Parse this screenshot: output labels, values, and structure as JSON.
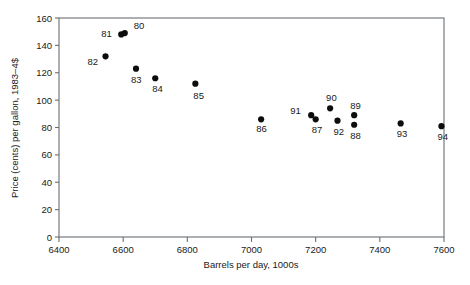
{
  "chart_data": {
    "type": "scatter",
    "title": "",
    "xlabel": "Barrels per day, 1000s",
    "ylabel": "Price (cents) per gallon, 1983–4$",
    "xlim": [
      6400,
      7600
    ],
    "ylim": [
      0,
      160
    ],
    "xticks": [
      6400,
      6600,
      6800,
      7000,
      7200,
      7400,
      7600
    ],
    "yticks": [
      0,
      20,
      40,
      60,
      80,
      100,
      120,
      140,
      160
    ],
    "grid": false,
    "legend": null,
    "point_color": "#0d0d0d",
    "frame_color": "#6b6f74",
    "points": [
      {
        "label": "80",
        "x": 6605,
        "y": 149,
        "label_dx": 9,
        "label_dy": -4
      },
      {
        "label": "81",
        "x": 6594,
        "y": 148,
        "label_dx": -20,
        "label_dy": 3
      },
      {
        "label": "82",
        "x": 6545,
        "y": 132,
        "label_dx": -18,
        "label_dy": 9
      },
      {
        "label": "83",
        "x": 6640,
        "y": 123,
        "label_dx": -5,
        "label_dy": 14
      },
      {
        "label": "84",
        "x": 6700,
        "y": 116,
        "label_dx": -3,
        "label_dy": 14
      },
      {
        "label": "85",
        "x": 6825,
        "y": 112,
        "label_dx": -2,
        "label_dy": 15
      },
      {
        "label": "86",
        "x": 7030,
        "y": 86,
        "label_dx": -5,
        "label_dy": 13
      },
      {
        "label": "87",
        "x": 7200,
        "y": 86,
        "label_dx": -4,
        "label_dy": 14
      },
      {
        "label": "88",
        "x": 7320,
        "y": 82,
        "label_dx": -4,
        "label_dy": 14
      },
      {
        "label": "89",
        "x": 7320,
        "y": 89,
        "label_dx": -4,
        "label_dy": -6
      },
      {
        "label": "90",
        "x": 7245,
        "y": 94,
        "label_dx": -4,
        "label_dy": -7
      },
      {
        "label": "91",
        "x": 7186,
        "y": 89,
        "label_dx": -21,
        "label_dy": -1
      },
      {
        "label": "92",
        "x": 7268,
        "y": 85,
        "label_dx": -4,
        "label_dy": 14
      },
      {
        "label": "93",
        "x": 7465,
        "y": 83,
        "label_dx": -4,
        "label_dy": 14
      },
      {
        "label": "94",
        "x": 7592,
        "y": 81,
        "label_dx": -4,
        "label_dy": 14
      }
    ]
  }
}
